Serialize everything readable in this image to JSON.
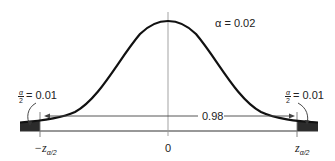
{
  "diagram": {
    "type": "normal-distribution-two-tailed",
    "alpha_label": "α = 0.02",
    "center_area_label": "0.98",
    "left_tail": {
      "fraction_numerator": "α",
      "fraction_denominator": "2",
      "value_text": "= 0.01"
    },
    "right_tail": {
      "fraction_numerator": "α",
      "fraction_denominator": "2",
      "value_text": "= 0.01"
    },
    "x_axis": {
      "left_critical": {
        "prefix": "−z",
        "subscript": "α/2"
      },
      "center": "0",
      "right_critical": {
        "prefix": "z",
        "subscript": "α/2"
      }
    },
    "colors": {
      "curve": "#111111",
      "tail_fill": "#2b2b2b",
      "axis": "#333333",
      "guide": "#888888"
    }
  }
}
